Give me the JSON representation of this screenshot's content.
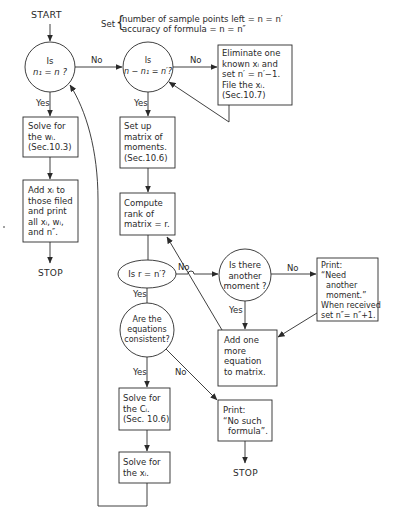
{
  "start_label": "START",
  "setup_note": {
    "prefix": "Set",
    "line1": "number of sample points left = n = n′",
    "line2": "accuracy of formula = n = n″"
  },
  "nodes": {
    "decision_n1_eq_n": {
      "line1": "Is",
      "line2": "n₁ = n ?"
    },
    "decision_n_minus_n1": {
      "line1": "Is",
      "line2": "n − n₁ = n′?"
    },
    "eliminate_box": [
      "Eliminate one",
      "known xᵢ and",
      "set n′ = n′−1.",
      "File the xᵢ.",
      "(Sec.10.7)"
    ],
    "solve_w_box": [
      "Solve for",
      "the wᵢ.",
      "(Sec.10.3)"
    ],
    "add_xi_box": [
      "Add xᵢ to",
      "those filed",
      "and print",
      "all xᵢ, wᵢ,",
      "and n″."
    ],
    "stop_left": "STOP",
    "setup_matrix_box": [
      "Set up",
      "matrix of",
      "moments.",
      "(Sec.10.6)"
    ],
    "compute_rank_box": [
      "Compute",
      "rank of",
      "matrix = r."
    ],
    "decision_r_eq_n": "Is r = n′?",
    "decision_another_moment": [
      "Is there",
      "another",
      "moment ?"
    ],
    "print_need_box": [
      "Print:",
      "“Need",
      "another",
      "moment.”",
      "When received",
      "set n″= n″+1."
    ],
    "add_equation_box": [
      "Add one",
      "more",
      "equation",
      "to matrix."
    ],
    "decision_consistent": [
      "Are the",
      "equations",
      "consistent?"
    ],
    "solve_c_box": [
      "Solve for",
      "the Cᵢ.",
      "(Sec. 10.6)"
    ],
    "solve_x_box": [
      "Solve for",
      "the xᵢ."
    ],
    "print_no_formula_box": [
      "Print:",
      "“No such",
      "formula”."
    ],
    "stop_right": "STOP"
  },
  "edge_labels": {
    "no": "No",
    "yes": "Yes"
  },
  "colors": {
    "ink": "#2a2a2a",
    "paper": "#ffffff"
  }
}
